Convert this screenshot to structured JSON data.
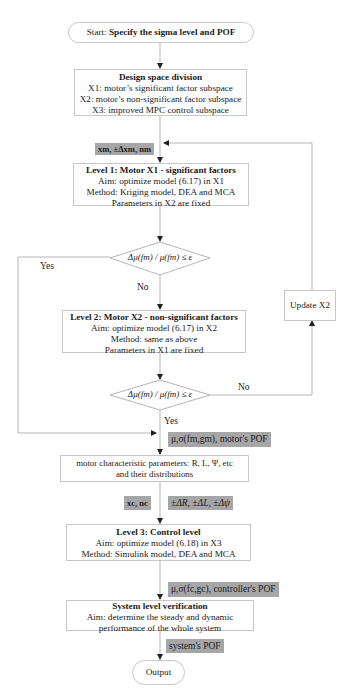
{
  "start": {
    "prefix": "Start: ",
    "title": "Specify the sigma level and POF"
  },
  "design_space": {
    "title": "Design space division",
    "lines": [
      "X1: motor’s significant factor subspace",
      "X2: motor’s non-significant factor subspace",
      "X3: improved MPC control subspace"
    ]
  },
  "label_motor_vars": "xm, ±Δxm, nm",
  "level1": {
    "title": "Level 1: Motor X1 - significant factors",
    "lines": [
      "Aim: optimize model (6.17) in X1",
      "Method: Kriging model, DEA and MCA",
      "Parameters in X2 are fixed"
    ]
  },
  "decision1": {
    "condition": "Δμ(fm) / μ(fm) ≤ ε",
    "yes": "Yes",
    "no": "No"
  },
  "level2": {
    "title": "Level 2: Motor X2 - non-significant factors",
    "lines": [
      "Aim: optimize model (6.17) in X2",
      "Method: same as above",
      "Parameters in X1 are fixed"
    ]
  },
  "update_x2": "Update X2",
  "decision2": {
    "condition": "Δμ(fm) / μ(fm) ≤ ε",
    "yes": "Yes",
    "no": "No"
  },
  "label_motor_pof": "μ,σ(fm,gm), motor's POF",
  "motor_params": {
    "lines": [
      "motor characteristic parameters: R, L, Ψ, etc",
      "and their distributions"
    ]
  },
  "label_control_vars": "xc, nc",
  "label_deltas": "±ΔR, ±ΔL, ±Δψ",
  "level3": {
    "title": "Level 3: Control level",
    "lines": [
      "Aim: optimize model (6.18) in X3",
      "Method: Simulink model, DEA and MCA"
    ]
  },
  "label_controller_pof": "μ,σ(fc,gc), controller's POF",
  "system_verification": {
    "title": "System level verification",
    "lines": [
      "Aim: determine the steady and dynamic",
      "performance of the whole system"
    ]
  },
  "label_system_pof": "system's POF",
  "output": "Output"
}
